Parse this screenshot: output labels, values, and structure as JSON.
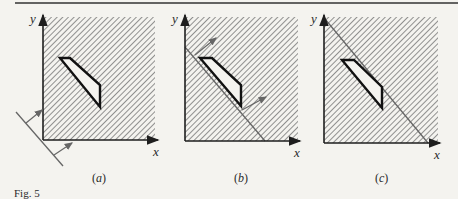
{
  "figure": {
    "caption": "Fig. 5",
    "panels": [
      {
        "id": "a",
        "label_open": "(",
        "label_letter": "a",
        "label_close": ")",
        "x_axis_label": "x",
        "y_axis_label": "y",
        "description": "Hatched first quadrant with trapezoid-shaped hole; a line outside the quadrant at lower-left with two arrows pointing into the region"
      },
      {
        "id": "b",
        "label_open": "(",
        "label_letter": "b",
        "label_close": ")",
        "x_axis_label": "x",
        "y_axis_label": "y",
        "description": "Hatched first quadrant with hole; a line touching the hole's lower-left edge with two arrows pointing up-right"
      },
      {
        "id": "c",
        "label_open": "(",
        "label_letter": "c",
        "label_close": ")",
        "x_axis_label": "x",
        "y_axis_label": "y",
        "description": "Hatched first quadrant with hole; a line touching the hole's right corner passing from y-axis top to x-axis"
      }
    ]
  },
  "colors": {
    "background": "#f4f3ef",
    "ink": "#1e1e1e",
    "hatch": "#555555",
    "arrow": "#666666"
  }
}
